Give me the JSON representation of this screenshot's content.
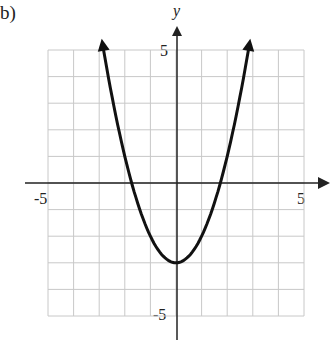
{
  "problem_label": "b)",
  "chart_data": {
    "type": "line",
    "title": "",
    "xlabel": "",
    "ylabel": "y",
    "xlim": [
      -5,
      5
    ],
    "ylim": [
      -5,
      5
    ],
    "grid": true,
    "tick_labels": {
      "x": [
        "-5",
        "5"
      ],
      "y": [
        "5",
        "-5"
      ]
    },
    "series": [
      {
        "name": "y = x^2 - 3",
        "equation": "y = x^2 - 3",
        "vertex": [
          0,
          -3
        ],
        "x_intercepts": [
          -1.73,
          1.73
        ],
        "x": [
          -2.85,
          -2,
          -1,
          0,
          1,
          2,
          2.85
        ],
        "values": [
          5.12,
          1,
          -2,
          -3,
          -2,
          1,
          5.12
        ]
      }
    ]
  },
  "colors": {
    "grid": "#c8c8c8",
    "curve": "#111111",
    "axis": "#222222"
  }
}
